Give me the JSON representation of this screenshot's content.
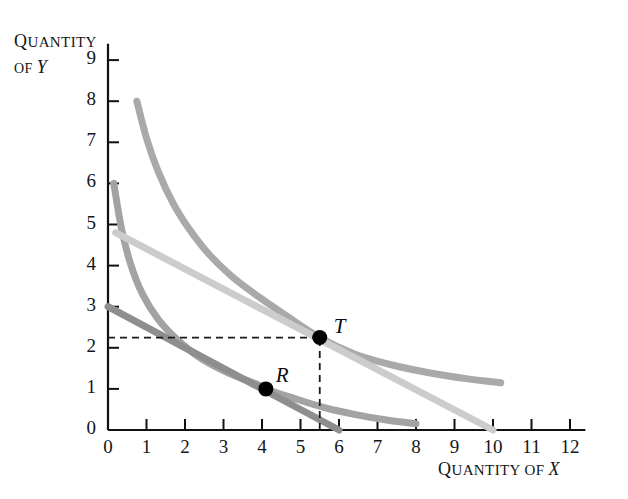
{
  "figure": {
    "y_axis_title_line1": "Q",
    "y_axis_title": "QUANTITY",
    "y_axis_title_line2": "OF",
    "y_axis_variable": "Y",
    "x_axis_title": "QUANTITY OF",
    "x_axis_variable": "X"
  },
  "chart_data": {
    "type": "line",
    "title": "",
    "xlabel": "QUANTITY OF X",
    "ylabel": "QUANTITY OF Y",
    "xlim": [
      0,
      12.4
    ],
    "ylim": [
      0,
      9.4
    ],
    "xticks": [
      0,
      1,
      2,
      3,
      4,
      5,
      6,
      7,
      8,
      9,
      10,
      11,
      12
    ],
    "yticks": [
      0,
      1,
      2,
      3,
      4,
      5,
      6,
      7,
      8,
      9
    ],
    "xtick_labels": [
      "0",
      "1",
      "2",
      "3",
      "4",
      "5",
      "6",
      "7",
      "8",
      "9",
      "10",
      "11",
      "12"
    ],
    "ytick_labels": [
      "0",
      "1",
      "2",
      "3",
      "4",
      "5",
      "6",
      "7",
      "8",
      "9"
    ],
    "grid": false,
    "legend": "none",
    "series": [
      {
        "name": "higher-indifference-curve",
        "type": "curve",
        "color": "#a9a9a9",
        "width": 7,
        "points": [
          [
            0.75,
            8.0
          ],
          [
            1.0,
            7.1
          ],
          [
            1.3,
            6.3
          ],
          [
            1.7,
            5.5
          ],
          [
            2.1,
            4.9
          ],
          [
            2.6,
            4.3
          ],
          [
            3.2,
            3.75
          ],
          [
            3.9,
            3.25
          ],
          [
            4.6,
            2.8
          ],
          [
            5.5,
            2.25
          ],
          [
            6.4,
            1.85
          ],
          [
            7.3,
            1.6
          ],
          [
            8.3,
            1.4
          ],
          [
            9.3,
            1.25
          ],
          [
            10.2,
            1.15
          ]
        ]
      },
      {
        "name": "lower-indifference-curve",
        "type": "curve",
        "color": "#a3a3a3",
        "width": 7,
        "points": [
          [
            0.15,
            6.0
          ],
          [
            0.35,
            4.9
          ],
          [
            0.6,
            4.0
          ],
          [
            0.9,
            3.3
          ],
          [
            1.3,
            2.7
          ],
          [
            1.8,
            2.2
          ],
          [
            2.4,
            1.75
          ],
          [
            3.1,
            1.4
          ],
          [
            3.9,
            1.1
          ],
          [
            4.1,
            1.0
          ],
          [
            4.8,
            0.78
          ],
          [
            5.6,
            0.55
          ],
          [
            6.4,
            0.38
          ],
          [
            7.2,
            0.25
          ],
          [
            8.0,
            0.15
          ]
        ]
      },
      {
        "name": "budget-line",
        "type": "line",
        "color": "#8e8e8e",
        "width": 7,
        "points": [
          [
            0,
            3.0
          ],
          [
            6.0,
            0.0
          ]
        ]
      },
      {
        "name": "rotated-budget-line",
        "type": "line",
        "color": "#cccccc",
        "width": 7,
        "points": [
          [
            0.2,
            4.8
          ],
          [
            10.0,
            0.0
          ]
        ]
      }
    ],
    "points": [
      {
        "label": "T",
        "x": 5.5,
        "y": 2.25,
        "label_dx": 14,
        "label_dy": -24
      },
      {
        "label": "R",
        "x": 4.1,
        "y": 1.0,
        "label_dx": 10,
        "label_dy": -26
      }
    ],
    "dashed_guides": [
      {
        "name": "horizontal-guide-T",
        "from": [
          0,
          2.25
        ],
        "to": [
          5.5,
          2.25
        ]
      },
      {
        "name": "vertical-guide-T",
        "from": [
          5.5,
          0
        ],
        "to": [
          5.5,
          2.25
        ]
      }
    ]
  }
}
